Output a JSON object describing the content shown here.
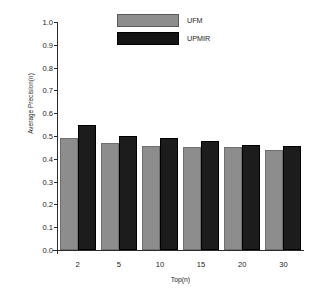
{
  "chart_data": {
    "type": "bar",
    "title": "",
    "xlabel": "Top(n)",
    "ylabel": "Average Precision(n)",
    "categories": [
      "2",
      "5",
      "10",
      "15",
      "20",
      "30"
    ],
    "series": [
      {
        "name": "UFM",
        "color": "#8d8d8d",
        "values": [
          0.49,
          0.47,
          0.455,
          0.45,
          0.45,
          0.44
        ]
      },
      {
        "name": "UPMIR",
        "color": "#1c1c1c",
        "values": [
          0.55,
          0.5,
          0.49,
          0.48,
          0.46,
          0.455
        ]
      }
    ],
    "ylim": [
      0.0,
      1.0
    ],
    "yticks": [
      "0.0",
      "0.1",
      "0.2",
      "0.3",
      "0.4",
      "0.5",
      "0.6",
      "0.7",
      "0.8",
      "0.9",
      "1.0"
    ],
    "ytick_values": [
      0.0,
      0.1,
      0.2,
      0.3,
      0.4,
      0.5,
      0.6,
      0.7,
      0.8,
      0.9,
      1.0
    ],
    "grid": false,
    "legend_position": "top-center"
  },
  "legend": {
    "items": [
      {
        "label": "UFM"
      },
      {
        "label": "UPMIR"
      }
    ]
  }
}
